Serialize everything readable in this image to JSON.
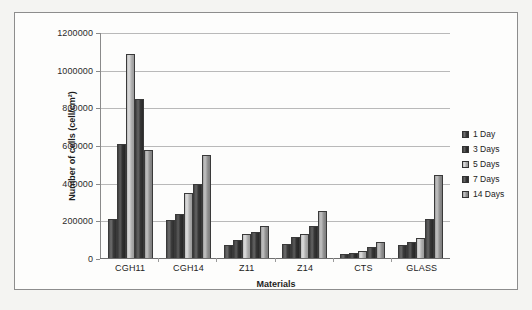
{
  "chart_data": {
    "type": "bar",
    "title": "",
    "xlabel": "Materials",
    "ylabel": "Number of cells (cell/cm²)",
    "categories": [
      "CGH11",
      "CGH14",
      "Z11",
      "Z14",
      "CTS",
      "GLASS"
    ],
    "series": [
      {
        "name": "1 Day",
        "color": "#4a4a4a",
        "values": [
          205000,
          202000,
          70000,
          72000,
          22000,
          70000
        ]
      },
      {
        "name": "3 Days",
        "color": "#3c3c3c",
        "values": [
          605000,
          232000,
          95000,
          110000,
          28000,
          85000
        ]
      },
      {
        "name": "5 Days",
        "color": "#bdbdbd",
        "values": [
          1085000,
          345000,
          125000,
          125000,
          38000,
          105000
        ]
      },
      {
        "name": "7 Days",
        "color": "#434343",
        "values": [
          845000,
          395000,
          140000,
          170000,
          60000,
          205000
        ]
      },
      {
        "name": "14 Days",
        "color": "#9e9e9e",
        "values": [
          575000,
          548000,
          170000,
          250000,
          85000,
          440000
        ]
      }
    ],
    "ylim": [
      0,
      1200000
    ],
    "yticks": [
      0,
      200000,
      400000,
      600000,
      800000,
      1000000,
      1200000
    ],
    "ytick_labels": [
      "0",
      "200000",
      "400000",
      "600000",
      "800000",
      "1000000",
      "1200000"
    ],
    "grid": true,
    "legend_position": "right"
  }
}
